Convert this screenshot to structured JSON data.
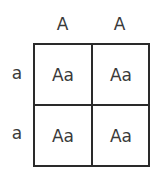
{
  "punnett": {
    "columns": [
      "A",
      "A"
    ],
    "rows": [
      "a",
      "a"
    ],
    "cells": [
      [
        "Aa",
        "Aa"
      ],
      [
        "Aa",
        "Aa"
      ]
    ]
  }
}
